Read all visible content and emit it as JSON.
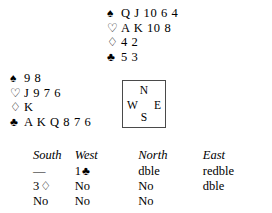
{
  "diagram": {
    "type": "bridge-deal",
    "suit_symbols": {
      "spade": "♠",
      "heart": "♡",
      "diamond": "♢",
      "club": "♣"
    },
    "hands": {
      "north": {
        "label": "North",
        "spades_symbol": "♠",
        "spades": "Q J 10 6 4",
        "hearts_symbol": "♡",
        "hearts": "A K 10 8",
        "diamonds_symbol": "♢",
        "diamonds": "4 2",
        "clubs_symbol": "♣",
        "clubs": "5 3"
      },
      "west": {
        "label": "West",
        "spades_symbol": "♠",
        "spades": "9 8",
        "hearts_symbol": "♡",
        "hearts": "J 9 7 6",
        "diamonds_symbol": "♢",
        "diamonds": "K",
        "clubs_symbol": "♣",
        "clubs": "A K Q 8 7 6"
      }
    },
    "compass": {
      "north": "N",
      "west": "W",
      "east": "E",
      "south": "S"
    }
  },
  "bidding": {
    "headers": [
      "South",
      "West",
      "North",
      "East"
    ],
    "rows": [
      {
        "south": "—",
        "south_suit": "",
        "west": "1",
        "west_suit": "♣",
        "north": "dble",
        "north_suit": "",
        "east": "redble",
        "east_suit": ""
      },
      {
        "south": "3",
        "south_suit": "♢",
        "west": "No",
        "west_suit": "",
        "north": "No",
        "north_suit": "",
        "east": "dble",
        "east_suit": ""
      },
      {
        "south": "No",
        "south_suit": "",
        "west": "No",
        "west_suit": "",
        "north": "No",
        "north_suit": "",
        "east": "",
        "east_suit": ""
      }
    ]
  },
  "colors": {
    "text": "#000000",
    "background": "#ffffff",
    "box_border": "#4a4a4a"
  }
}
